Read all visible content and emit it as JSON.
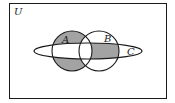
{
  "diagram": {
    "type": "venn",
    "universe_label": "U",
    "sets": [
      {
        "id": "A",
        "label": "A",
        "shape": "circle"
      },
      {
        "id": "B",
        "label": "B",
        "shape": "circle"
      },
      {
        "id": "C",
        "label": "C",
        "shape": "ellipse"
      }
    ],
    "shaded_regions": [
      {
        "description": "A only (not B, not C)",
        "expression": "A - B - C"
      },
      {
        "description": "B and C, not A",
        "expression": "(B ∩ C) - A"
      }
    ],
    "shading_expression": "(A − (B ∪ C)) ∪ ((B ∩ C) − A)",
    "colors": {
      "shade": "#a3a3a3",
      "stroke": "#1a1a1a",
      "background": "#ffffff"
    }
  }
}
